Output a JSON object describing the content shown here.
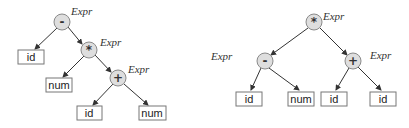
{
  "diagram": {
    "type": "expression-trees",
    "trees": [
      {
        "name": "left-tree",
        "nodes": [
          {
            "id": "L1",
            "kind": "op",
            "symbol": "-",
            "label": "Expr",
            "x": 62,
            "y": 22
          },
          {
            "id": "L2",
            "kind": "leaf",
            "text": "id",
            "x": 31,
            "y": 57
          },
          {
            "id": "L3",
            "kind": "op",
            "symbol": "*",
            "label": "Expr",
            "x": 89,
            "y": 50
          },
          {
            "id": "L4",
            "kind": "leaf",
            "text": "num",
            "x": 59,
            "y": 85
          },
          {
            "id": "L5",
            "kind": "op",
            "symbol": "+",
            "label": "Expr",
            "x": 118,
            "y": 78
          },
          {
            "id": "L6",
            "kind": "leaf",
            "text": "id",
            "x": 89,
            "y": 113
          },
          {
            "id": "L7",
            "kind": "leaf",
            "text": "num",
            "x": 152,
            "y": 113
          }
        ],
        "edges": [
          [
            "L1",
            "L2"
          ],
          [
            "L1",
            "L3"
          ],
          [
            "L3",
            "L4"
          ],
          [
            "L3",
            "L5"
          ],
          [
            "L5",
            "L6"
          ],
          [
            "L5",
            "L7"
          ]
        ]
      },
      {
        "name": "right-tree",
        "nodes": [
          {
            "id": "R1",
            "kind": "op",
            "symbol": "*",
            "label": "Expr",
            "x": 314,
            "y": 22
          },
          {
            "id": "R2",
            "kind": "op",
            "symbol": "-",
            "label": "Expr",
            "x": 265,
            "y": 61,
            "label_side": "left"
          },
          {
            "id": "R3",
            "kind": "op",
            "symbol": "+",
            "label": "Expr",
            "x": 353,
            "y": 61
          },
          {
            "id": "R4",
            "kind": "leaf",
            "text": "id",
            "x": 249,
            "y": 99
          },
          {
            "id": "R5",
            "kind": "leaf",
            "text": "num",
            "x": 301,
            "y": 99
          },
          {
            "id": "R6",
            "kind": "leaf",
            "text": "id",
            "x": 334,
            "y": 99
          },
          {
            "id": "R7",
            "kind": "leaf",
            "text": "id",
            "x": 383,
            "y": 99
          }
        ],
        "edges": [
          [
            "R1",
            "R2"
          ],
          [
            "R1",
            "R3"
          ],
          [
            "R2",
            "R4"
          ],
          [
            "R2",
            "R5"
          ],
          [
            "R3",
            "R6"
          ],
          [
            "R3",
            "R7"
          ]
        ]
      }
    ]
  },
  "labels": {
    "L1": "Expr",
    "L3": "Expr",
    "L5": "Expr",
    "R1": "Expr",
    "R2": "Expr",
    "R3": "Expr"
  },
  "symbols": {
    "L1": "-",
    "L3": "*",
    "L5": "+",
    "R1": "*",
    "R2": "-",
    "R3": "+"
  },
  "leaves": {
    "L2": "id",
    "L4": "num",
    "L6": "id",
    "L7": "num",
    "R4": "id",
    "R5": "num",
    "R6": "id",
    "R7": "id"
  },
  "colors": {
    "op_fill": "#dedede",
    "op_stroke": "#8a8a8a",
    "leaf_stroke": "#777777",
    "edge": "#333333"
  }
}
